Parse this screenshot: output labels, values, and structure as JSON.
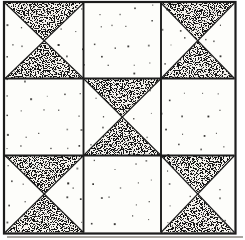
{
  "illustration": {
    "subject": "quilt-block-pattern",
    "block_style": "nine-patch of hourglass (quarter-square triangle) units",
    "grid_rows": 3,
    "grid_cols": 3,
    "grid": [
      [
        "hourglass",
        "plain",
        "hourglass"
      ],
      [
        "plain",
        "hourglass",
        "plain"
      ],
      [
        "hourglass",
        "plain",
        "hourglass"
      ]
    ],
    "hourglass_shaded_triangles": [
      "top",
      "bottom"
    ],
    "textures": {
      "shaded_fill": "dense-random-stipple",
      "plain_fill": "white-with-sparse-scattered-dots"
    },
    "colors": {
      "ink": "#1c1c1c",
      "paper": "#ffffff",
      "block_background": "#fdfdfa",
      "stipple_base": "#f6f4ef",
      "speckle": "#141414",
      "fabric_dot": "#2e2d2b",
      "shadow": "#a8a5a0"
    }
  }
}
